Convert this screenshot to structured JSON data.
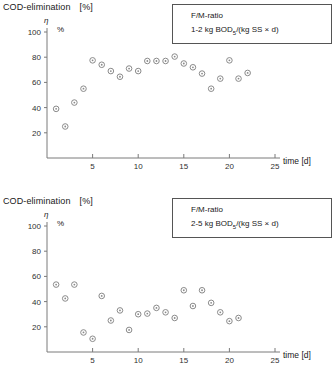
{
  "panels": [
    {
      "axis_title": "COD-elimination",
      "axis_title_unit": "[%]",
      "eta_symbol": "η",
      "percent_symbol": "%",
      "legend": {
        "line1": "F/M-ratio",
        "line2_prefix": "2-5 kg BOD",
        "line2_sub": "5",
        "line2_suffix": "/(kg SS × d)"
      },
      "x_axis_name": "time [d]"
    }
  ],
  "chart_data": [
    {
      "type": "scatter",
      "title": "COD-elimination [%]",
      "subtitle": "F/M-ratio 1-2 kg BOD5/(kg SS × d)",
      "xlabel": "time [d]",
      "ylabel": "η %",
      "xlim": [
        0,
        25
      ],
      "ylim": [
        0,
        100
      ],
      "xticks": [
        5,
        10,
        15,
        20,
        25
      ],
      "yticks": [
        20,
        40,
        60,
        80,
        100
      ],
      "grid": false,
      "legend_position": "top-right",
      "marker": "open-circle-dot",
      "marker_color": "#8a8a8a",
      "legend": {
        "line1": "F/M-ratio",
        "line2": "1-2 kg BOD5/(kg SS × d)"
      },
      "axis_title": "COD-elimination",
      "axis_title_unit": "[%]",
      "eta_symbol": "η",
      "percent_symbol": "%",
      "x": [
        1,
        2,
        3,
        4,
        5,
        6,
        7,
        8,
        9,
        10,
        11,
        12,
        13,
        14,
        15,
        16,
        17,
        18,
        19,
        20,
        21,
        22
      ],
      "y": [
        39,
        25,
        44,
        55,
        77.5,
        74,
        69,
        64.5,
        71,
        69,
        77,
        77,
        77,
        80.5,
        75,
        72,
        67,
        55,
        63,
        77.5,
        63,
        67.5
      ]
    },
    {
      "type": "scatter",
      "title": "COD-elimination [%]",
      "subtitle": "F/M-ratio 2-5 kg BOD5/(kg SS × d)",
      "xlabel": "time [d]",
      "ylabel": "η %",
      "xlim": [
        0,
        25
      ],
      "ylim": [
        0,
        100
      ],
      "xticks": [
        5,
        10,
        15,
        20,
        25
      ],
      "yticks": [
        20,
        40,
        60,
        80,
        100
      ],
      "grid": false,
      "legend_position": "top-right",
      "marker": "open-circle-dot",
      "marker_color": "#8a8a8a",
      "legend": {
        "line1": "F/M-ratio",
        "line2": "2-5 kg BOD5/(kg SS × d)"
      },
      "axis_title": "COD-elimination",
      "axis_title_unit": "[%]",
      "eta_symbol": "η",
      "percent_symbol": "%",
      "x": [
        1,
        2,
        3,
        4,
        5,
        6,
        7,
        8,
        9,
        10,
        11,
        12,
        13,
        14,
        15,
        16,
        17,
        18,
        19,
        20,
        21
      ],
      "y": [
        53.5,
        42.5,
        53.5,
        15.5,
        10.5,
        44.5,
        25,
        33,
        17.5,
        30,
        30.5,
        35,
        31.5,
        27,
        49,
        36.5,
        49,
        39,
        31.5,
        24.5,
        27
      ]
    }
  ],
  "chart1": {
    "axis_title": "COD-elimination",
    "axis_title_unit": "[%]",
    "eta_symbol": "η",
    "percent_symbol": "%",
    "x_axis_name": "time [d]",
    "legend": {
      "line1": "F/M-ratio",
      "line2_prefix": "1-2 kg BOD",
      "line2_sub": "5",
      "line2_suffix": "/(kg SS × d)"
    }
  },
  "chart2": {
    "axis_title": "COD-elimination",
    "axis_title_unit": "[%]",
    "eta_symbol": "η",
    "percent_symbol": "%",
    "x_axis_name": "time [d]",
    "legend": {
      "line1": "F/M-ratio",
      "line2_prefix": "2-5 kg BOD",
      "line2_sub": "5",
      "line2_suffix": "/(kg SS × d)"
    }
  }
}
